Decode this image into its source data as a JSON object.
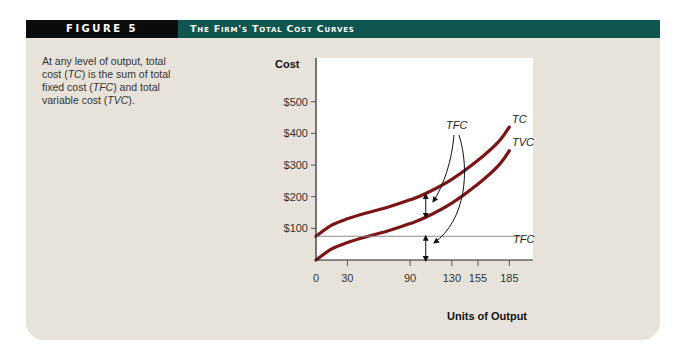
{
  "header": {
    "figure_label": "FIGURE 5",
    "title": "The Firm's Total Cost Curves",
    "colors": {
      "label_bg": "#0b0b0b",
      "title_bg": "#0f5650",
      "panel_bg": "#e8e3da"
    }
  },
  "caption": {
    "parts": [
      "At any level of output, total cost (",
      "TC",
      ") is the sum of total fixed cost (",
      "TFC",
      ") and total variable cost (",
      "TVC",
      ")."
    ]
  },
  "chart_data": {
    "type": "line",
    "title": "The Firm's Total Cost Curves",
    "xlabel": "Units of Output",
    "ylabel": "Cost",
    "x_ticks": [
      0,
      30,
      90,
      130,
      155,
      185
    ],
    "x_tick_labels": [
      "0",
      "30",
      "90",
      "130",
      "155",
      "185"
    ],
    "y_ticks": [
      100,
      200,
      300,
      400,
      500
    ],
    "y_tick_labels": [
      "$100",
      "$200",
      "$300",
      "$400",
      "$500"
    ],
    "xlim": [
      0,
      200
    ],
    "ylim": [
      0,
      600
    ],
    "grid": false,
    "series": [
      {
        "name": "TC",
        "color": "#7a1416",
        "x": [
          0,
          15,
          30,
          50,
          70,
          90,
          105,
          130,
          155,
          175,
          185
        ],
        "y": [
          75,
          110,
          130,
          150,
          168,
          190,
          210,
          255,
          315,
          375,
          420
        ]
      },
      {
        "name": "TVC",
        "color": "#7a1416",
        "x": [
          0,
          15,
          30,
          50,
          70,
          90,
          105,
          130,
          155,
          175,
          185
        ],
        "y": [
          0,
          35,
          55,
          75,
          93,
          115,
          135,
          180,
          240,
          300,
          345
        ]
      },
      {
        "name": "TFC",
        "color": "#888888",
        "x": [
          0,
          210
        ],
        "y": [
          75,
          75
        ]
      }
    ],
    "annotations": [
      {
        "text": "TFC",
        "note": "arrows point to the vertical gap between TC and TVC and to the gap between TFC and x-axis at output ≈ 105"
      },
      {
        "text": "TC",
        "position": "end of TC curve"
      },
      {
        "text": "TVC",
        "position": "end of TVC curve"
      },
      {
        "text": "TFC",
        "position": "right end of horizontal line"
      }
    ]
  }
}
